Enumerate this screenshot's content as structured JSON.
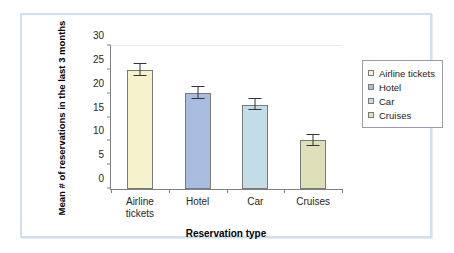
{
  "frame": {
    "border_color": "#cfe0ef"
  },
  "chart_data": {
    "type": "bar",
    "title": "",
    "xlabel": "Reservation type",
    "ylabel": "Mean # of reservations in the last 3 months",
    "ylim": [
      0,
      30
    ],
    "yticks": [
      0,
      5,
      10,
      15,
      20,
      25,
      30
    ],
    "ytick_labels": [
      "0",
      "5",
      "10",
      "15",
      "20",
      "25",
      "30"
    ],
    "grid": false,
    "legend_position": "right",
    "categories": [
      "Airline tickets",
      "Hotel",
      "Car",
      "Cruises"
    ],
    "category_labels": [
      [
        "Airline",
        "tickets"
      ],
      [
        "Hotel"
      ],
      [
        "Car"
      ],
      [
        "Cruises"
      ]
    ],
    "values": [
      25.0,
      20.2,
      17.7,
      10.2
    ],
    "errors": [
      1.2,
      1.3,
      1.2,
      1.2
    ],
    "colors": [
      "#f5f2cc",
      "#a8bce0",
      "#c2dce8",
      "#dde0b8"
    ],
    "legend": [
      {
        "label": "Airline tickets",
        "color": "#f5f2cc"
      },
      {
        "label": "Hotel",
        "color": "#a8bce0"
      },
      {
        "label": "Car",
        "color": "#c2dce8"
      },
      {
        "label": "Cruises",
        "color": "#dde0b8"
      }
    ]
  }
}
